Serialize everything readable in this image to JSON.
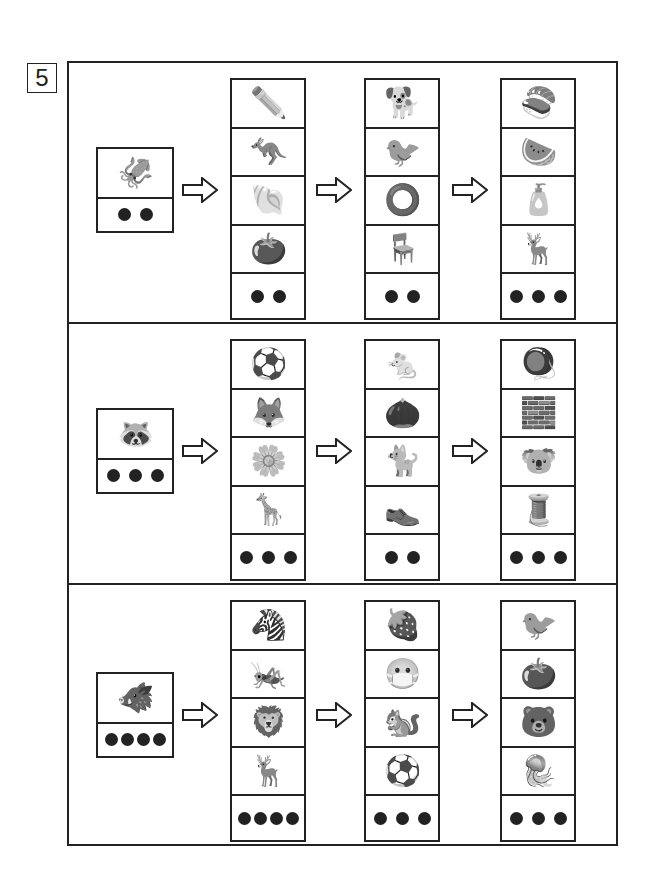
{
  "question_number": "5",
  "rows": [
    {
      "start": {
        "item": "squid",
        "glyph": "🦑",
        "dots": 2
      },
      "arrow_icon": "arrow-right-icon",
      "columns": [
        {
          "items": [
            {
              "name": "pencil",
              "glyph": "✏️"
            },
            {
              "name": "kangaroo",
              "glyph": "🦘"
            },
            {
              "name": "shells",
              "glyph": "🐚"
            },
            {
              "name": "persimmon",
              "glyph": "🍅"
            }
          ],
          "dots": 2
        },
        {
          "items": [
            {
              "name": "dog",
              "glyph": "🐕"
            },
            {
              "name": "pheasant",
              "glyph": "🐦"
            },
            {
              "name": "beads",
              "glyph": "⭕"
            },
            {
              "name": "chair",
              "glyph": "🪑"
            }
          ],
          "dots": 2
        },
        {
          "items": [
            {
              "name": "sushi",
              "glyph": "🍣"
            },
            {
              "name": "watermelon",
              "glyph": "🍉"
            },
            {
              "name": "water-canteen",
              "glyph": "🧴"
            },
            {
              "name": "deer",
              "glyph": "🦌"
            }
          ],
          "dots": 3
        }
      ]
    },
    {
      "start": {
        "item": "raccoon-dog",
        "glyph": "🦝",
        "dots": 3
      },
      "arrow_icon": "arrow-right-icon",
      "columns": [
        {
          "items": [
            {
              "name": "ball",
              "glyph": "⚽"
            },
            {
              "name": "fox",
              "glyph": "🦊"
            },
            {
              "name": "chrysanthemum",
              "glyph": "🌼"
            },
            {
              "name": "giraffe",
              "glyph": "🦒"
            }
          ],
          "dots": 3
        },
        {
          "items": [
            {
              "name": "mouse",
              "glyph": "🐁"
            },
            {
              "name": "chestnut",
              "glyph": "🌰"
            },
            {
              "name": "cat",
              "glyph": "🐈"
            },
            {
              "name": "shoes",
              "glyph": "👞"
            }
          ],
          "dots": 2
        },
        {
          "items": [
            {
              "name": "spinning-top",
              "glyph": "🪀"
            },
            {
              "name": "blocks",
              "glyph": "🧱"
            },
            {
              "name": "koala",
              "glyph": "🐨"
            },
            {
              "name": "sewing-machine",
              "glyph": "🧵"
            }
          ],
          "dots": 3
        }
      ]
    },
    {
      "start": {
        "item": "wild-boar",
        "glyph": "🐗",
        "dots": 4
      },
      "arrow_icon": "arrow-right-icon",
      "columns": [
        {
          "items": [
            {
              "name": "zebra",
              "glyph": "🦓"
            },
            {
              "name": "mantis",
              "glyph": "🦗"
            },
            {
              "name": "lion-dance",
              "glyph": "🦁"
            },
            {
              "name": "reindeer",
              "glyph": "🦌"
            }
          ],
          "dots": 4
        },
        {
          "items": [
            {
              "name": "strawberry",
              "glyph": "🍓"
            },
            {
              "name": "mask",
              "glyph": "😷"
            },
            {
              "name": "chipmunk",
              "glyph": "🐿️"
            },
            {
              "name": "ball",
              "glyph": "⚽"
            }
          ],
          "dots": 3
        },
        {
          "items": [
            {
              "name": "sparrow",
              "glyph": "🐦"
            },
            {
              "name": "tomato",
              "glyph": "🍅"
            },
            {
              "name": "bear",
              "glyph": "🐻"
            },
            {
              "name": "jellyfish",
              "glyph": "🪼"
            }
          ],
          "dots": 3
        }
      ]
    }
  ]
}
